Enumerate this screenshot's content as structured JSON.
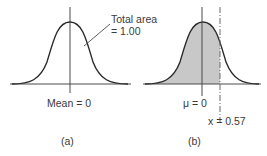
{
  "panels": [
    {
      "id": "a",
      "caption": "(a)",
      "center_label": "Mean = 0",
      "annotation": {
        "line1": "Total area",
        "line2": "= 1.00"
      },
      "shaded": false
    },
    {
      "id": "b",
      "caption": "(b)",
      "center_label": "μ = 0",
      "marker_label": "x = 0.57",
      "marker_value": 0.57,
      "shaded": true,
      "shade_color": "#c8c8c8"
    }
  ],
  "colors": {
    "curve": "#2a2a2a",
    "axis": "#4a4a4a",
    "shade": "#c8c8c8"
  }
}
